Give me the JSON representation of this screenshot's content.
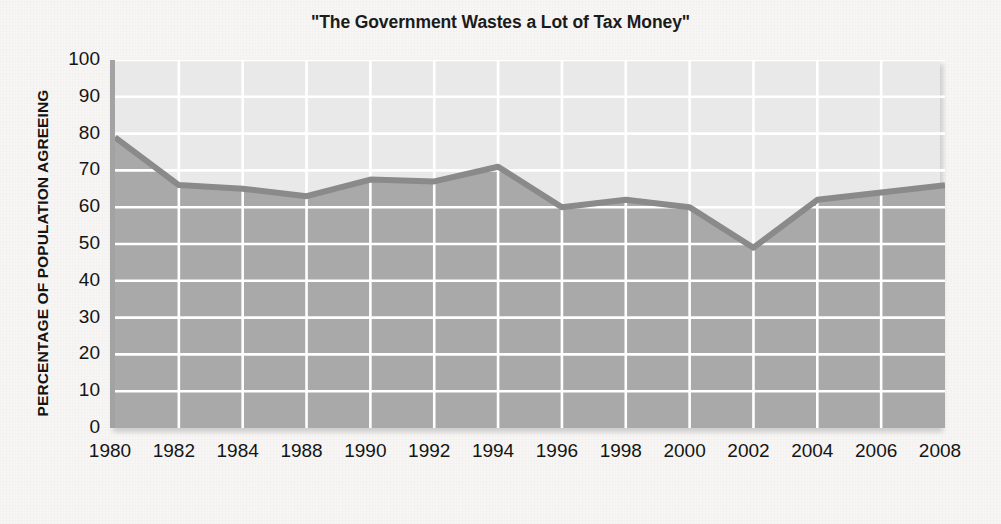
{
  "chart_data": {
    "type": "area",
    "title": "\"The Government Wastes a Lot of Tax Money\"",
    "xlabel": "",
    "ylabel": "PERCENTAGE OF POPULATION AGREEING",
    "categories": [
      "1980",
      "1982",
      "1984",
      "1988",
      "1990",
      "1992",
      "1994",
      "1996",
      "1998",
      "2000",
      "2002",
      "2004",
      "2006",
      "2008"
    ],
    "values": [
      79,
      66,
      65,
      63,
      67.5,
      67,
      71,
      60,
      62,
      60,
      49,
      62,
      64,
      66
    ],
    "series": [
      {
        "name": "Percentage agreeing",
        "values": [
          79,
          66,
          65,
          63,
          67.5,
          67,
          71,
          60,
          62,
          60,
          49,
          62,
          64,
          66
        ]
      }
    ],
    "ylim": [
      0,
      100
    ],
    "ytick_labels": [
      "100",
      "90",
      "80",
      "70",
      "60",
      "50",
      "40",
      "30",
      "20",
      "10",
      "0"
    ],
    "ytick_values": [
      100,
      90,
      80,
      70,
      60,
      50,
      40,
      30,
      20,
      10,
      0
    ],
    "ytick_step": 10,
    "grid": true,
    "grid_color": "#ffffff",
    "legend": false,
    "legend_position": "none",
    "fill_color": "#a9a9a9",
    "upper_color": "#e9e9e9",
    "line_color": "#8a8a8a",
    "axis_color": "#a3a3a3",
    "page_color": "#f7f6f4",
    "text_color": "#151515",
    "annotations": []
  }
}
